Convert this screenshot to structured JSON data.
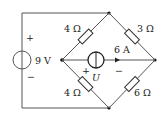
{
  "circuit": {
    "voltage_source": {
      "label": "9 V",
      "plus": "+",
      "minus": "−"
    },
    "current_source": {
      "label": "6 A",
      "voltage_label": "U",
      "plus": "+",
      "minus": "−"
    },
    "resistors": {
      "top_left": "4 Ω",
      "top_right": "3 Ω",
      "bottom_left": "4 Ω",
      "bottom_right": "6 Ω"
    }
  }
}
